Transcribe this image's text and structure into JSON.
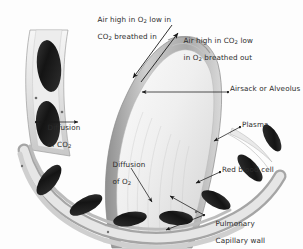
{
  "figure": {
    "type": "anatomical-illustration",
    "palette": {
      "background": "#ffffff",
      "text": "#2b2b2b",
      "leader_line": "#1a1a1a",
      "alveolus_lumen": "#f2f2f2",
      "alveolar_wall": "#bdbdbd",
      "capillary_wall": "#d8d8d8",
      "plasma": "#ececec",
      "red_blood_cell": "#1c1c1c"
    }
  },
  "labels": {
    "breathed_in": {
      "line1": "Air high in O",
      "sub1": "2",
      "line1b": " low in",
      "line2": "CO",
      "sub2": "2",
      "line2b": " breathed in"
    },
    "breathed_out": {
      "line1": "Air high in CO",
      "sub1": "2",
      "line1b": " low",
      "line2": "in O",
      "sub2": "2",
      "line2b": " breathed out"
    },
    "alveolus": {
      "text": "Airsack or Alveolus"
    },
    "plasma": {
      "text": "Plasma"
    },
    "red_blood_cell": {
      "text": "Red blood cell"
    },
    "capillary_wall": {
      "line1": "Pulmonary",
      "line2": "Capillary wall"
    },
    "diffusion_co2": {
      "line1": "Diffusion",
      "line2": "of CO",
      "sub2": "2"
    },
    "diffusion_o2": {
      "line1": "Diffusion",
      "line2": "of O",
      "sub2": "2"
    }
  }
}
